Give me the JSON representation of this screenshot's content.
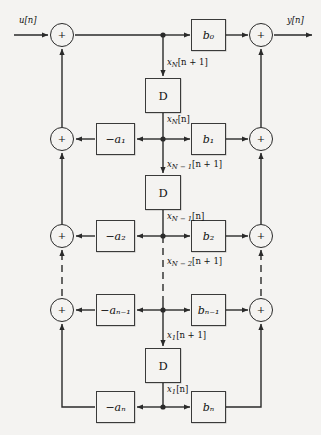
{
  "diagram": {
    "colors": {
      "background": "#f4f3f1",
      "line": "#2a2a2a",
      "block_border": "#3a3a3a",
      "text": "#111111"
    },
    "io": {
      "input_label": "u[n]",
      "output_label": "y[n]"
    },
    "summers": {
      "plus_symbol": "+",
      "left": [
        {
          "name": "summer-left-row1"
        },
        {
          "name": "summer-left-row2"
        },
        {
          "name": "summer-left-row3"
        },
        {
          "name": "summer-left-row4"
        }
      ],
      "right": [
        {
          "name": "summer-right-row1"
        },
        {
          "name": "summer-right-row2"
        },
        {
          "name": "summer-right-row3"
        },
        {
          "name": "summer-right-row4"
        }
      ]
    },
    "delay_blocks": [
      {
        "label": "D",
        "name": "delay-block-1"
      },
      {
        "label": "D",
        "name": "delay-block-2"
      },
      {
        "label": "D",
        "name": "delay-block-3"
      }
    ],
    "feedback_gains": [
      {
        "label": "−a₁",
        "name": "gain-minus-a1"
      },
      {
        "label": "−a₂",
        "name": "gain-minus-a2"
      },
      {
        "label": "−aₙ₋₁",
        "name": "gain-minus-a-N-1"
      },
      {
        "label": "−aₙ",
        "name": "gain-minus-a-N"
      }
    ],
    "feedforward_gains": [
      {
        "label": "b₀",
        "name": "gain-b0"
      },
      {
        "label": "b₁",
        "name": "gain-b1"
      },
      {
        "label": "b₂",
        "name": "gain-b2"
      },
      {
        "label": "bₙ₋₁",
        "name": "gain-b-N-1"
      },
      {
        "label": "bₙ",
        "name": "gain-b-N"
      }
    ],
    "state_labels": [
      {
        "name": "state-xN-next",
        "base": "x",
        "sub": "N",
        "rest": "[n + 1]"
      },
      {
        "name": "state-xN",
        "base": "x",
        "sub": "N",
        "rest": "[n]"
      },
      {
        "name": "state-xN-1-next",
        "base": "x",
        "sub": "N − 1",
        "rest": "[n + 1]"
      },
      {
        "name": "state-xN-1",
        "base": "x",
        "sub": "N − 1",
        "rest": "[n]"
      },
      {
        "name": "state-xN-2-next",
        "base": "x",
        "sub": "N − 2",
        "rest": "[n + 1]"
      },
      {
        "name": "state-x1-next",
        "base": "x",
        "sub": "1",
        "rest": "[n + 1]"
      },
      {
        "name": "state-x1",
        "base": "x",
        "sub": "1",
        "rest": "[n]"
      }
    ]
  }
}
